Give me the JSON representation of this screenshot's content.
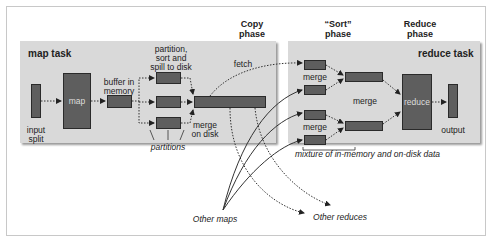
{
  "phases": {
    "copy": "Copy phase",
    "copy_line1": "Copy",
    "copy_line2": "phase",
    "sort_line1": "“Sort”",
    "sort_line2": "phase",
    "reduce_line1": "Reduce",
    "reduce_line2": "phase"
  },
  "map_task": {
    "title": "map task",
    "input_split_line1": "input",
    "input_split_line2": "split",
    "map": "map",
    "buffer_line1": "buffer in",
    "buffer_line2": "memory",
    "spill_line1": "partition,",
    "spill_line2": "sort and",
    "spill_line3": "spill to disk",
    "partitions": "partitions",
    "merge_disk_line1": "merge",
    "merge_disk_line2": "on disk"
  },
  "fetch": "fetch",
  "reduce_task": {
    "title": "reduce task",
    "merge1": "merge",
    "merge2": "merge",
    "merge3": "merge",
    "reduce": "reduce",
    "output": "output",
    "mixture": "mixture of in-memory and on-disk data"
  },
  "other_maps": "Other maps",
  "other_reduces": "Other reduces",
  "colors": {
    "panel": "#d9d9d9",
    "box": "#5e5e5e",
    "box_border": "#2a2a2a"
  }
}
